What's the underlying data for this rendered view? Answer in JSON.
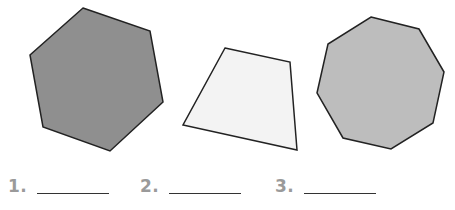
{
  "worksheet": {
    "shapes": [
      {
        "name": "hexagon",
        "sides": 6,
        "fill": "#8f8f8f",
        "stroke": "#222222"
      },
      {
        "name": "quadrilateral",
        "sides": 4,
        "fill": "#f3f3f3",
        "stroke": "#222222"
      },
      {
        "name": "octagon",
        "sides": 8,
        "fill": "#bdbdbd",
        "stroke": "#222222"
      }
    ],
    "answers": [
      {
        "label": "1.",
        "value": ""
      },
      {
        "label": "2.",
        "value": ""
      },
      {
        "label": "3.",
        "value": ""
      }
    ]
  }
}
